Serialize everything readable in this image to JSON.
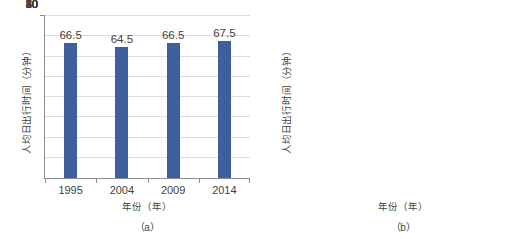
{
  "chart_data": [
    {
      "id": "a",
      "type": "bar",
      "title": "",
      "caption": "（a）",
      "categories": [
        "1995",
        "2004",
        "2009",
        "2014"
      ],
      "values": [
        66.5,
        64.5,
        66.5,
        67.5
      ],
      "value_labels": [
        "66.5",
        "64.5",
        "66.5",
        "67.5"
      ],
      "xlabel": "年份（年）",
      "ylabel": "人均日出行时间（分钟）",
      "ylim": [
        0,
        80
      ],
      "yticks": [
        0,
        10,
        20,
        30,
        40,
        50,
        60,
        70,
        80
      ],
      "ytick_labels": [
        "0",
        "10",
        "20",
        "30",
        "40",
        "50",
        "60",
        "70",
        "80"
      ],
      "grid": true,
      "legend": "none",
      "bar_color": "#3e5f9d"
    },
    {
      "id": "b",
      "type": "bar",
      "title": "",
      "caption": "（b）",
      "categories": [
        "1968",
        "1978",
        "1988",
        "2008"
      ],
      "values": [
        76.4,
        73.9,
        74.1,
        84
      ],
      "value_labels": [
        "76.4",
        "73.9",
        "74.1",
        "84"
      ],
      "xlabel": "年份（年）",
      "ylabel": "人均日出行时间（分钟）",
      "ylim": [
        0,
        100
      ],
      "yticks": [
        0,
        20,
        40,
        60,
        80,
        100
      ],
      "ytick_labels": [
        "0",
        "20",
        "40",
        "60",
        "80",
        "100"
      ],
      "grid": true,
      "legend": "none",
      "bar_color": "#55a630"
    }
  ]
}
